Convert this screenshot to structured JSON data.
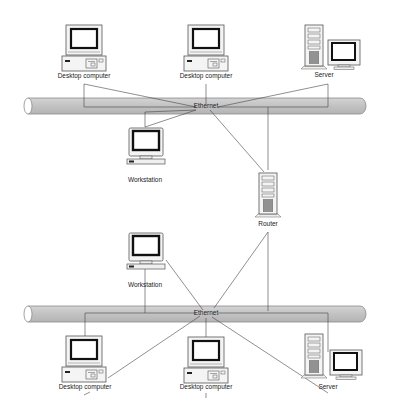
{
  "diagram": {
    "type": "network-topology",
    "segments": [
      {
        "id": "top",
        "backbone_label": "Ethernet",
        "nodes": [
          {
            "id": "top-desktop-1",
            "type": "desktop",
            "label": "Desktop computer"
          },
          {
            "id": "top-desktop-2",
            "type": "desktop",
            "label": "Desktop computer"
          },
          {
            "id": "top-server",
            "type": "server",
            "label": "Server"
          },
          {
            "id": "top-workstation",
            "type": "workstation",
            "label": "Workstation"
          }
        ]
      },
      {
        "id": "bottom",
        "backbone_label": "Ethernet",
        "nodes": [
          {
            "id": "bottom-workstation",
            "type": "workstation",
            "label": "Workstation"
          },
          {
            "id": "bottom-desktop-1",
            "type": "desktop",
            "label": "Desktop computer"
          },
          {
            "id": "bottom-desktop-2",
            "type": "desktop",
            "label": "Desktop computer"
          },
          {
            "id": "bottom-server",
            "type": "server",
            "label": "Server"
          }
        ]
      }
    ],
    "router": {
      "id": "router",
      "type": "router",
      "label": "Router"
    },
    "colors": {
      "cable_fill": "#c8c8c8",
      "cable_stroke": "#8a8a8a",
      "line": "#444444",
      "screen": "#1a1a1a",
      "device_stroke": "#555555"
    }
  },
  "labels": {
    "top_desktop_1": "Desktop computer",
    "top_desktop_2": "Desktop computer",
    "top_server": "Server",
    "top_ethernet": "Ethernet",
    "top_workstation": "Workstation",
    "router": "Router",
    "bottom_workstation": "Workstation",
    "bottom_ethernet": "Ethernet",
    "bottom_desktop_1": "Desktop computer",
    "bottom_desktop_2": "Desktop computer",
    "bottom_server": "Server"
  }
}
